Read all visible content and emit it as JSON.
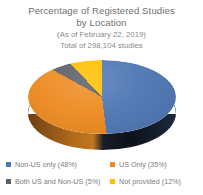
{
  "header": {
    "title_line1": "Percentage of Registered Studies",
    "title_line2": "by Location",
    "subtitle_line1": "(As of February  22, 2019)",
    "subtitle_line2": "Total of 298,104 studies"
  },
  "colors": {
    "non_us_only": "#4F77B5",
    "us_only": "#ED8B21",
    "both_us_and_non_us": "#5B5F66",
    "not_provided": "#FFC000",
    "title_text": "#6F6F6F",
    "legend_text": "#7D7D7D",
    "background": "#FFFFFF"
  },
  "chart_data": {
    "type": "pie",
    "title": "Percentage of Registered Studies by Location",
    "subtitle": "(As of February  22, 2019) Total of 298,104 studies",
    "total_studies": "298,104",
    "as_of_date": "February 22, 2019",
    "legend_position": "bottom",
    "grid": false,
    "categories": [
      "Non-US only",
      "US Only",
      "Both US and Non-US",
      "Not provided"
    ],
    "values": [
      48,
      35,
      5,
      12
    ],
    "unit": "%",
    "slices": [
      {
        "label": "Non-US only",
        "value": 48,
        "color": "#4F77B5",
        "legend_text": "Non-US only (48%)"
      },
      {
        "label": "US Only",
        "value": 35,
        "color": "#ED8B21",
        "legend_text": "US Only (35%)"
      },
      {
        "label": "Both US and Non-US",
        "value": 5,
        "color": "#5B5F66",
        "legend_text": "Both US and Non-US (5%)"
      },
      {
        "label": "Not provided",
        "value": 12,
        "color": "#FFC000",
        "legend_text": "Not provided (12%)"
      }
    ]
  },
  "legend": {
    "items": [
      {
        "label": "Non-US only (48%)",
        "color": "#4F77B5"
      },
      {
        "label": "US Only (35%)",
        "color": "#ED8B21"
      },
      {
        "label": "Both US and Non-US (5%)",
        "color": "#5B5F66"
      },
      {
        "label": "Not provided (12%)",
        "color": "#FFC000"
      }
    ]
  }
}
